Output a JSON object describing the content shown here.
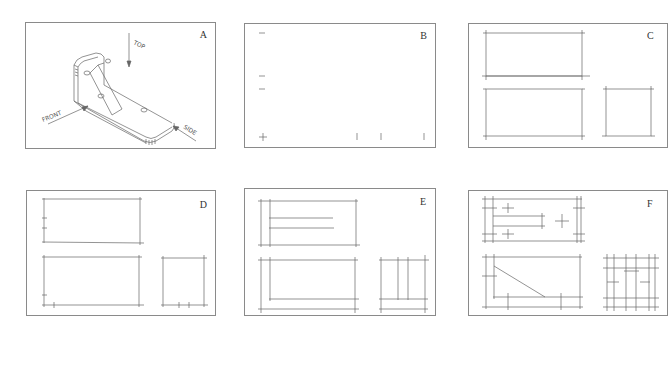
{
  "figure": {
    "panels": [
      {
        "id": "A",
        "label": "A",
        "description": "isometric pictorial of angle bracket with view arrows"
      },
      {
        "id": "B",
        "label": "B",
        "description": "layout marks for views"
      },
      {
        "id": "C",
        "label": "C",
        "description": "blocked-in outlines of top, front, and side views"
      },
      {
        "id": "D",
        "label": "D",
        "description": "outlines with feature location ticks"
      },
      {
        "id": "E",
        "label": "E",
        "description": "construction lines added for features"
      },
      {
        "id": "F",
        "label": "F",
        "description": "detailed construction of all views"
      }
    ],
    "view_labels": {
      "top": "TOP",
      "front": "FRONT",
      "side": "SIDE"
    }
  }
}
